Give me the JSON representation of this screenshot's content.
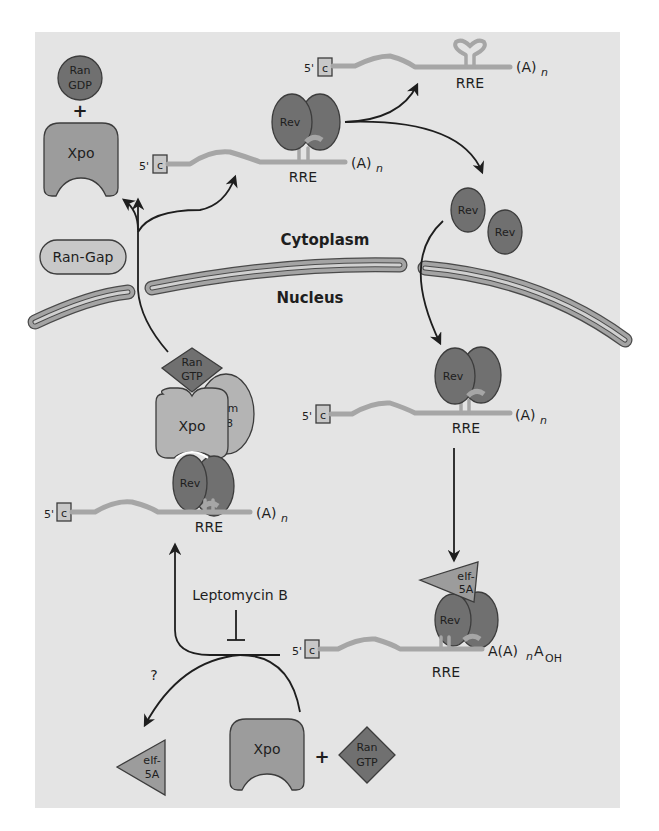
{
  "figure": {
    "colors": {
      "panel_background": "#e4e4e4",
      "page_background": "#ffffff",
      "dark_protein": "#707070",
      "medium_protein": "#9c9c9c",
      "rna_strand": "#a6a6a6",
      "membrane": "#a4a4a4",
      "line": "#1e1e1e"
    },
    "compartments": {
      "cytoplasm": "Cytoplasm",
      "nucleus": "Nucleus"
    },
    "cytoplasm": {
      "ran_gdp": {
        "line1": "Ran",
        "line2": "GDP"
      },
      "plus": "+",
      "xpo": "Xpo",
      "ran_gap": "Ran-Gap",
      "mrna_top": {
        "cap_prime": "5'",
        "cap": "c",
        "element": "RRE",
        "tail": "(A)",
        "tail_sub": "n"
      },
      "mrna_rev_complex": {
        "cap_prime": "5'",
        "cap": "c",
        "protein": "Rev",
        "element": "RRE",
        "tail": "(A)",
        "tail_sub": "n"
      },
      "free_rev_1": "Rev",
      "free_rev_2": "Rev"
    },
    "nucleus": {
      "mrna_rev_complex": {
        "cap_prime": "5'",
        "cap": "c",
        "protein": "Rev",
        "element": "RRE",
        "tail": "(A)",
        "tail_sub": "n"
      },
      "export_complex": {
        "ran_gtp": {
          "line1": "Ran",
          "line2": "GTP"
        },
        "xpo": "Xpo",
        "sam68": {
          "line1": "Sam",
          "line2": "68"
        },
        "rev": "Rev",
        "cap_prime": "5'",
        "cap": "c",
        "element": "RRE",
        "tail": "(A)",
        "tail_sub": "n"
      },
      "eif_complex": {
        "eif": {
          "line1": "eIf-",
          "line2": "5A"
        },
        "rev": "Rev",
        "cap_prime": "5'",
        "cap": "c",
        "element": "RRE",
        "tail_a": "A(A)",
        "tail_sub": "n",
        "tail_end": "A",
        "tail_end_sub": "OH"
      },
      "inhibitor": "Leptomycin B",
      "unknown": "?",
      "released_eif": {
        "line1": "eIf-",
        "line2": "5A"
      },
      "free_xpo": "Xpo",
      "plus": "+",
      "free_ran_gtp": {
        "line1": "Ran",
        "line2": "GTP"
      }
    }
  }
}
